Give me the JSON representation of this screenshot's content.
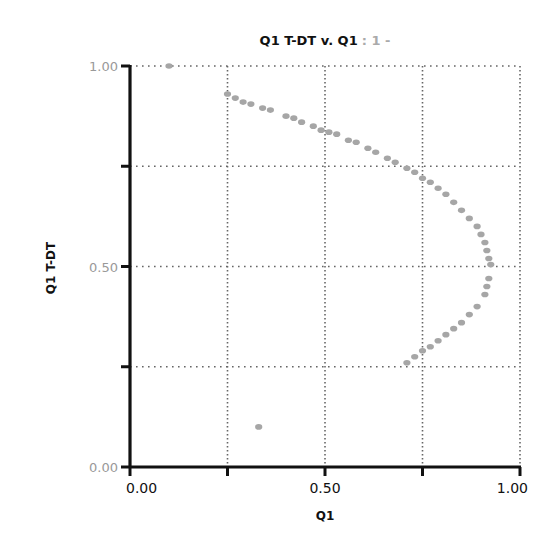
{
  "chart_data": {
    "type": "scatter",
    "title": "Q1 T-DT v. Q1",
    "title_suffix": ": 1 -",
    "xlabel": "Q1",
    "ylabel": "Q1 T-DT",
    "xlim": [
      0,
      1
    ],
    "ylim": [
      0,
      1
    ],
    "grid": true,
    "grid_style": "dotted",
    "x_tick_labels": [
      {
        "value": 0.0,
        "label": "0.00"
      },
      {
        "value": 0.5,
        "label": "0.50"
      },
      {
        "value": 1.0,
        "label": "1.00"
      }
    ],
    "x_ticks": [
      0.0,
      0.25,
      0.5,
      0.75,
      1.0
    ],
    "y_tick_labels": [
      {
        "value": 0.0,
        "label": "0.00"
      },
      {
        "value": 0.5,
        "label": "0.50"
      },
      {
        "value": 1.0,
        "label": "1.00"
      }
    ],
    "y_ticks": [
      0.0,
      0.25,
      0.5,
      0.75,
      1.0
    ],
    "marker_color": "#a6a6a6",
    "series": [
      {
        "name": "Q1 T-DT v. Q1",
        "points": [
          [
            0.1,
            1.0
          ],
          [
            0.25,
            0.93
          ],
          [
            0.27,
            0.92
          ],
          [
            0.29,
            0.91
          ],
          [
            0.31,
            0.905
          ],
          [
            0.34,
            0.895
          ],
          [
            0.36,
            0.89
          ],
          [
            0.4,
            0.875
          ],
          [
            0.42,
            0.87
          ],
          [
            0.44,
            0.86
          ],
          [
            0.47,
            0.85
          ],
          [
            0.49,
            0.84
          ],
          [
            0.51,
            0.835
          ],
          [
            0.53,
            0.83
          ],
          [
            0.56,
            0.815
          ],
          [
            0.58,
            0.81
          ],
          [
            0.61,
            0.795
          ],
          [
            0.63,
            0.785
          ],
          [
            0.66,
            0.77
          ],
          [
            0.68,
            0.76
          ],
          [
            0.71,
            0.745
          ],
          [
            0.73,
            0.735
          ],
          [
            0.75,
            0.72
          ],
          [
            0.77,
            0.71
          ],
          [
            0.79,
            0.695
          ],
          [
            0.81,
            0.68
          ],
          [
            0.83,
            0.66
          ],
          [
            0.85,
            0.64
          ],
          [
            0.87,
            0.62
          ],
          [
            0.89,
            0.6
          ],
          [
            0.9,
            0.58
          ],
          [
            0.91,
            0.56
          ],
          [
            0.915,
            0.54
          ],
          [
            0.92,
            0.52
          ],
          [
            0.925,
            0.505
          ],
          [
            0.92,
            0.47
          ],
          [
            0.915,
            0.45
          ],
          [
            0.91,
            0.43
          ],
          [
            0.89,
            0.4
          ],
          [
            0.87,
            0.38
          ],
          [
            0.85,
            0.36
          ],
          [
            0.83,
            0.345
          ],
          [
            0.81,
            0.33
          ],
          [
            0.79,
            0.315
          ],
          [
            0.77,
            0.3
          ],
          [
            0.75,
            0.29
          ],
          [
            0.73,
            0.275
          ],
          [
            0.71,
            0.26
          ],
          [
            0.33,
            0.1
          ]
        ]
      }
    ]
  }
}
